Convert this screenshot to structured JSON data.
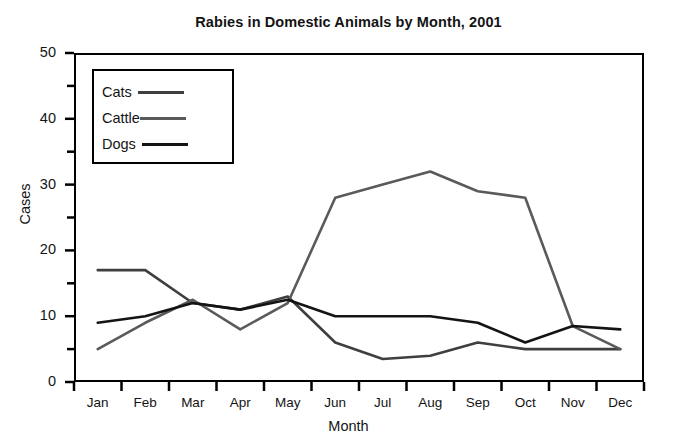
{
  "chart_data": {
    "type": "line",
    "title": "Rabies in Domestic Animals by Month, 2001",
    "xlabel": "Month",
    "ylabel": "Cases",
    "categories": [
      "Jan",
      "Feb",
      "Mar",
      "Apr",
      "May",
      "Jun",
      "Jul",
      "Aug",
      "Sep",
      "Oct",
      "Nov",
      "Dec"
    ],
    "ylim": [
      0,
      50
    ],
    "ytick_labels": [
      "0",
      "10",
      "20",
      "30",
      "40",
      "50"
    ],
    "ytick_values": [
      0,
      10,
      20,
      30,
      40,
      50
    ],
    "yminor_values": [
      5,
      15,
      25,
      35,
      45
    ],
    "grid": false,
    "legend_position": "upper-left-inside",
    "series": [
      {
        "name": "Cats",
        "color": "#3f3f3f",
        "values": [
          17,
          17,
          12,
          11,
          13,
          6,
          3.5,
          4,
          6,
          5,
          5,
          5
        ]
      },
      {
        "name": "Cattle",
        "color": "#5a5a5a",
        "values": [
          5,
          9,
          12.5,
          8,
          12,
          28,
          30,
          32,
          29,
          28,
          8.5,
          5
        ]
      },
      {
        "name": "Dogs",
        "color": "#141414",
        "values": [
          9,
          10,
          12,
          11,
          12.5,
          10,
          10,
          10,
          9,
          6,
          8.5,
          8
        ]
      }
    ]
  },
  "legend": {
    "entries": [
      {
        "label": "Cats"
      },
      {
        "label": "Cattle"
      },
      {
        "label": "Dogs"
      }
    ]
  }
}
